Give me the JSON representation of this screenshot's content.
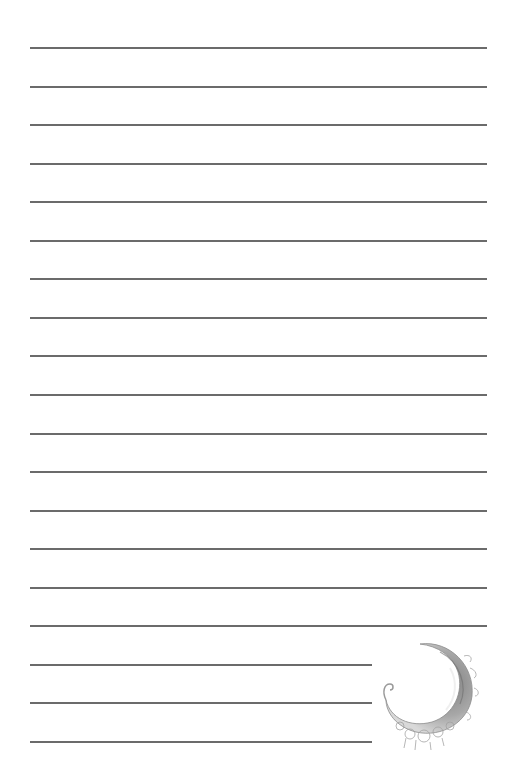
{
  "page": {
    "type": "lined stationery",
    "background": "#ffffff",
    "rule_color": "#6b6b6b",
    "rule_count": 19,
    "full_width_rules": 16,
    "short_rules": 3
  },
  "decoration": {
    "icon": "crescent-moon-ornament",
    "colors": [
      "#8a8a8a",
      "#b5b5b5",
      "#d6d6d6"
    ]
  }
}
